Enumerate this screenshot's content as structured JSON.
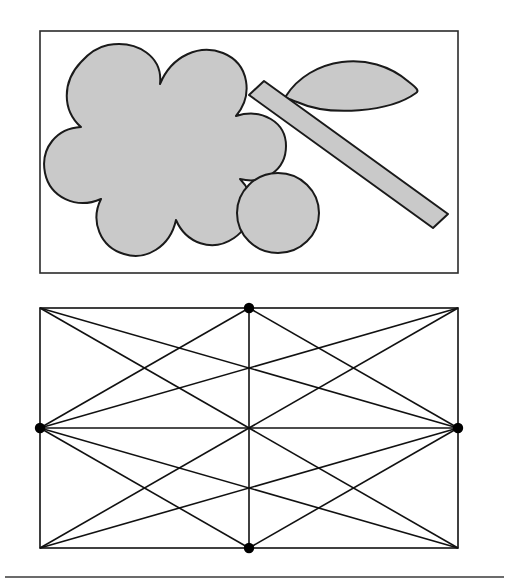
{
  "document": {
    "title": "Geometry figure plate",
    "background_color": "#ffffff",
    "width": 507,
    "height": 588
  },
  "style": {
    "shape_fill": "#c9c9c9",
    "shape_stroke": "#1a1a1a",
    "frame_stroke": "#2b2b2b",
    "lattice_stroke": "#111111",
    "dot_fill": "#000000",
    "rule_stroke": "#3a3a3a",
    "shape_stroke_width": 2.0,
    "frame_stroke_width": 1.6,
    "lattice_stroke_width": 1.6,
    "rule_stroke_width": 1.4,
    "dot_radius": 5.2
  },
  "panels": [
    {
      "id": "top-panel",
      "name": "shapes-panel",
      "frame": {
        "x": 40,
        "y": 31,
        "width": 418,
        "height": 242
      },
      "shapes": [
        {
          "id": "flower",
          "name": "flower-blob-shape",
          "kind": "blob",
          "lobes": 6,
          "center": [
            148,
            148
          ],
          "description": "Large six-lobed flower-like blob"
        },
        {
          "id": "circle",
          "name": "circle-shape",
          "kind": "circle",
          "center": [
            278,
            213
          ],
          "radius": 40
        },
        {
          "id": "leaf",
          "name": "leaf-lens-shape",
          "kind": "lens",
          "tip_left": [
            285,
            95
          ],
          "tip_right": [
            416,
            89
          ],
          "bulge": 34
        },
        {
          "id": "bar",
          "name": "diagonal-bar-shape",
          "kind": "rotated-rectangle",
          "start": [
            254,
            88
          ],
          "end": [
            443,
            220
          ],
          "thickness": 26,
          "angle_degrees": 35
        }
      ]
    },
    {
      "id": "bottom-panel",
      "name": "lattice-panel",
      "frame": {
        "x": 40,
        "y": 308,
        "width": 418,
        "height": 240
      },
      "grid": {
        "columns": 2,
        "rows": 2,
        "midpoint_x": 249,
        "midpoint_y": 428
      },
      "vertices": [
        {
          "name": "vertex-top-center",
          "x": 249,
          "y": 308,
          "marked": true
        },
        {
          "name": "vertex-middle-left",
          "x": 40,
          "y": 428,
          "marked": true
        },
        {
          "name": "vertex-middle-right",
          "x": 458,
          "y": 428,
          "marked": true
        },
        {
          "name": "vertex-bottom-center",
          "x": 249,
          "y": 548,
          "marked": true
        }
      ],
      "lines": [
        {
          "name": "line-horizontal-median",
          "x1": 40,
          "y1": 428,
          "x2": 458,
          "y2": 428
        },
        {
          "name": "line-vertical-median",
          "x1": 249,
          "y1": 308,
          "x2": 249,
          "y2": 548
        },
        {
          "name": "line-tl-cell-diag-down",
          "x1": 40,
          "y1": 308,
          "x2": 249,
          "y2": 428
        },
        {
          "name": "line-tl-cell-diag-up",
          "x1": 40,
          "y1": 428,
          "x2": 249,
          "y2": 308
        },
        {
          "name": "line-tr-cell-diag-down",
          "x1": 249,
          "y1": 308,
          "x2": 458,
          "y2": 428
        },
        {
          "name": "line-tr-cell-diag-up",
          "x1": 249,
          "y1": 428,
          "x2": 458,
          "y2": 308
        },
        {
          "name": "line-bl-cell-diag-down",
          "x1": 40,
          "y1": 428,
          "x2": 249,
          "y2": 548
        },
        {
          "name": "line-bl-cell-diag-up",
          "x1": 40,
          "y1": 548,
          "x2": 249,
          "y2": 428
        },
        {
          "name": "line-br-cell-diag-down",
          "x1": 249,
          "y1": 428,
          "x2": 458,
          "y2": 548
        },
        {
          "name": "line-br-cell-diag-up",
          "x1": 249,
          "y1": 548,
          "x2": 458,
          "y2": 428
        },
        {
          "name": "line-long-diag-top-left-to-right",
          "x1": 40,
          "y1": 308,
          "x2": 458,
          "y2": 428
        },
        {
          "name": "line-long-diag-left-to-top-right",
          "x1": 40,
          "y1": 428,
          "x2": 458,
          "y2": 308
        },
        {
          "name": "line-long-diag-left-to-bottom-right",
          "x1": 40,
          "y1": 428,
          "x2": 458,
          "y2": 548
        },
        {
          "name": "line-long-diag-bottom-left-to-right",
          "x1": 40,
          "y1": 548,
          "x2": 458,
          "y2": 428
        }
      ]
    }
  ],
  "footer_rule": {
    "name": "horizontal-rule",
    "x1": 5,
    "y1": 577,
    "x2": 504,
    "y2": 577
  }
}
